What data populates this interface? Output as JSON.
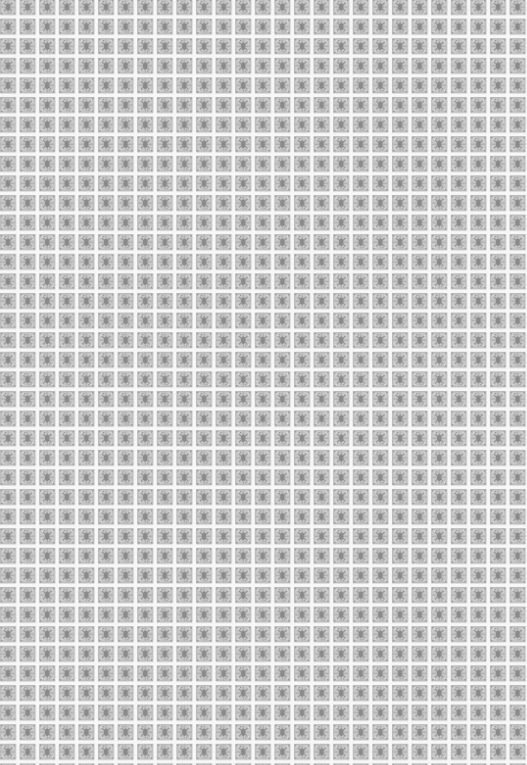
{
  "image": {
    "description": "Repeating gray ornamental tile texture with white grid lines",
    "colors": {
      "grid_line": "#f7f7f7",
      "tile_base": "#b4b4b4",
      "tile_dark": "#8c8c8c",
      "tile_light": "#d2d2d2"
    }
  }
}
